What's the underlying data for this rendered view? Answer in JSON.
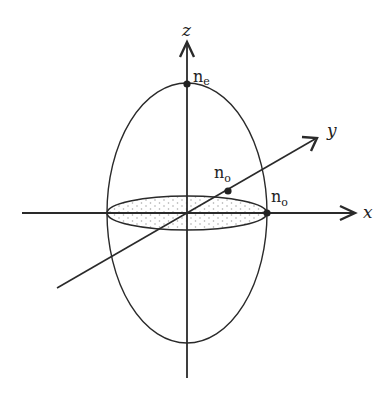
{
  "diagram": {
    "axes": {
      "x": "x",
      "y": "y",
      "z": "z"
    },
    "labels": {
      "ne": {
        "base": "n",
        "sub": "e"
      },
      "no_y": {
        "base": "n",
        "sub": "o"
      },
      "no_x": {
        "base": "n",
        "sub": "o"
      }
    },
    "colors": {
      "stroke": "#2a2a2a",
      "fill_dots": "#9a9a9a"
    }
  }
}
